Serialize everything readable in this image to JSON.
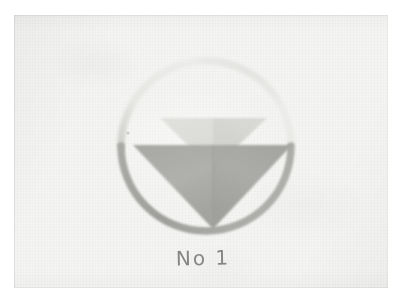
{
  "artwork": {
    "title": "No 1",
    "medium": "watercolour / gouache on paper",
    "caption_text": "No 1",
    "caption_label": "No",
    "caption_number": "1",
    "background_color": "#f4f4f2",
    "paper_edge_color": "#ffffff"
  },
  "composition": {
    "circle": {
      "center_x": 206,
      "center_y": 146,
      "radius": 85,
      "stroke_width": 7,
      "upper_arc_color": "#e2e2e0",
      "lower_arc_color": "#a7a7a4",
      "split_angle_deg": 0
    },
    "large_triangle": {
      "shape": "inverted-triangle",
      "apex_x": 213,
      "apex_y": 229,
      "top_left_x": 133,
      "top_right_x": 292,
      "top_y": 145,
      "left_half_color": "#a9a9a6",
      "right_half_color": "#a3a3a0",
      "seam_color": "#9a9a97"
    },
    "small_triangle": {
      "shape": "inverted-triangle",
      "apex_x": 213,
      "apex_y": 170,
      "top_left_x": 160,
      "top_right_x": 267,
      "top_y": 118,
      "left_half_color": "#dcdcd9",
      "right_half_color": "#d3d3d0",
      "opacity": 0.9
    }
  },
  "palette": {
    "lightest": "#f4f4f2",
    "light_gray": "#dcdcd9",
    "mid_gray": "#a9a9a6",
    "arc_faint": "#e2e2e0",
    "arc_dark": "#a7a7a4",
    "ink": "#6f6f6d"
  }
}
